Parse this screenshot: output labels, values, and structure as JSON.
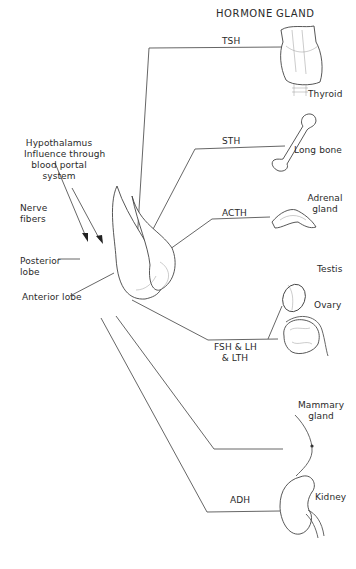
{
  "headers": {
    "hormone": "HORMONE",
    "gland": "GLAND"
  },
  "source": {
    "hypothalamus_label": [
      "Hypothalamus",
      "Influence through",
      "blood portal",
      "system"
    ],
    "nerve_fibers_label": [
      "Nerve",
      "fibers"
    ],
    "posterior_lobe_label": [
      "Posterior",
      "lobe"
    ],
    "anterior_lobe_label": "Anterior lobe"
  },
  "pathways": [
    {
      "hormone": "TSH",
      "gland": "Thyroid",
      "gland_icon": "thyroid-icon"
    },
    {
      "hormone": "STH",
      "gland": "Long bone",
      "gland_icon": "bone-icon"
    },
    {
      "hormone": "ACTH",
      "gland": [
        "Adrenal",
        "gland"
      ],
      "gland_icon": "adrenal-icon"
    },
    {
      "hormone": [
        "FSH & LH",
        "& LTH"
      ],
      "gland": [
        "Testis",
        "Ovary"
      ],
      "gland_icon": "gonad-icon"
    },
    {
      "hormone": "",
      "gland": [
        "Mammary",
        "gland"
      ],
      "gland_icon": "mammary-icon"
    },
    {
      "hormone": "ADH",
      "gland": "Kidney",
      "gland_icon": "kidney-icon"
    }
  ]
}
